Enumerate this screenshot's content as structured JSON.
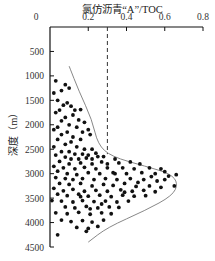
{
  "chart_data": {
    "type": "scatter",
    "title": "氯仿沥青“A”/TOC",
    "xlabel": "氯仿沥青“A”/TOC",
    "ylabel": "深度（m）",
    "x_axis_position": "top",
    "y_axis_inverted": true,
    "xlim": [
      0,
      0.8
    ],
    "ylim": [
      0,
      4500
    ],
    "x_ticks": [
      "0",
      "0.2",
      "0.4",
      "0.6",
      "0.8"
    ],
    "y_ticks": [
      "0",
      "500",
      "1000",
      "1500",
      "2000",
      "2500",
      "3000",
      "3500",
      "4000",
      "4500"
    ],
    "grid": false,
    "legend": null,
    "annotations": [
      {
        "type": "dashed_vertical_line",
        "x": 0.3,
        "y_from": 0,
        "y_to": 2600
      },
      {
        "type": "envelope_curve",
        "points": [
          [
            0.1,
            800
          ],
          [
            0.15,
            1300
          ],
          [
            0.22,
            1900
          ],
          [
            0.25,
            2400
          ],
          [
            0.32,
            2650
          ],
          [
            0.5,
            2850
          ],
          [
            0.63,
            3000
          ],
          [
            0.67,
            3200
          ],
          [
            0.64,
            3450
          ],
          [
            0.5,
            3750
          ],
          [
            0.3,
            4100
          ],
          [
            0.2,
            4400
          ]
        ]
      }
    ],
    "series": [
      {
        "name": "samples",
        "marker": "circle",
        "color": "#111111",
        "points": [
          [
            0.03,
            1100
          ],
          [
            0.06,
            1300
          ],
          [
            0.1,
            1250
          ],
          [
            0.02,
            1350
          ],
          [
            0.08,
            1180
          ],
          [
            0.04,
            1500
          ],
          [
            0.07,
            1600
          ],
          [
            0.11,
            1620
          ],
          [
            0.13,
            1700
          ],
          [
            0.16,
            1690
          ],
          [
            0.09,
            1550
          ],
          [
            0.05,
            1700
          ],
          [
            0.12,
            1800
          ],
          [
            0.03,
            1750
          ],
          [
            0.08,
            1850
          ],
          [
            0.15,
            1900
          ],
          [
            0.18,
            1950
          ],
          [
            0.06,
            1920
          ],
          [
            0.1,
            2000
          ],
          [
            0.04,
            2050
          ],
          [
            0.14,
            2050
          ],
          [
            0.2,
            2100
          ],
          [
            0.17,
            2150
          ],
          [
            0.02,
            2100
          ],
          [
            0.09,
            2150
          ],
          [
            0.12,
            2250
          ],
          [
            0.06,
            2200
          ],
          [
            0.16,
            2300
          ],
          [
            0.21,
            2200
          ],
          [
            0.04,
            2300
          ],
          [
            0.11,
            2350
          ],
          [
            0.08,
            2400
          ],
          [
            0.14,
            2450
          ],
          [
            0.18,
            2500
          ],
          [
            0.22,
            2500
          ],
          [
            0.02,
            2450
          ],
          [
            0.06,
            2550
          ],
          [
            0.1,
            2550
          ],
          [
            0.13,
            2600
          ],
          [
            0.17,
            2600
          ],
          [
            0.2,
            2620
          ],
          [
            0.24,
            2580
          ],
          [
            0.25,
            2650
          ],
          [
            0.03,
            2620
          ],
          [
            0.08,
            2660
          ],
          [
            0.11,
            2700
          ],
          [
            0.15,
            2700
          ],
          [
            0.19,
            2680
          ],
          [
            0.22,
            2700
          ],
          [
            0.28,
            2650
          ],
          [
            0.34,
            2700
          ],
          [
            0.05,
            2750
          ],
          [
            0.1,
            2800
          ],
          [
            0.16,
            2780
          ],
          [
            0.22,
            2800
          ],
          [
            0.27,
            2760
          ],
          [
            0.3,
            2800
          ],
          [
            0.36,
            2780
          ],
          [
            0.42,
            2760
          ],
          [
            0.47,
            2800
          ],
          [
            0.02,
            2850
          ],
          [
            0.07,
            2880
          ],
          [
            0.13,
            2900
          ],
          [
            0.18,
            2870
          ],
          [
            0.24,
            2900
          ],
          [
            0.3,
            2880
          ],
          [
            0.38,
            2880
          ],
          [
            0.44,
            2900
          ],
          [
            0.52,
            2880
          ],
          [
            0.58,
            2900
          ],
          [
            0.04,
            2950
          ],
          [
            0.09,
            3000
          ],
          [
            0.14,
            3020
          ],
          [
            0.2,
            2980
          ],
          [
            0.26,
            3000
          ],
          [
            0.33,
            2980
          ],
          [
            0.4,
            3000
          ],
          [
            0.48,
            2980
          ],
          [
            0.55,
            3000
          ],
          [
            0.62,
            3050
          ],
          [
            0.66,
            3020
          ],
          [
            0.03,
            3080
          ],
          [
            0.08,
            3100
          ],
          [
            0.12,
            3120
          ],
          [
            0.17,
            3100
          ],
          [
            0.23,
            3120
          ],
          [
            0.29,
            3100
          ],
          [
            0.35,
            3120
          ],
          [
            0.42,
            3100
          ],
          [
            0.49,
            3120
          ],
          [
            0.56,
            3150
          ],
          [
            0.6,
            3120
          ],
          [
            0.05,
            3200
          ],
          [
            0.1,
            3220
          ],
          [
            0.16,
            3200
          ],
          [
            0.22,
            3250
          ],
          [
            0.28,
            3220
          ],
          [
            0.33,
            3240
          ],
          [
            0.39,
            3200
          ],
          [
            0.45,
            3260
          ],
          [
            0.52,
            3250
          ],
          [
            0.58,
            3280
          ],
          [
            0.65,
            3250
          ],
          [
            0.02,
            3300
          ],
          [
            0.07,
            3350
          ],
          [
            0.12,
            3320
          ],
          [
            0.18,
            3360
          ],
          [
            0.24,
            3340
          ],
          [
            0.3,
            3360
          ],
          [
            0.37,
            3330
          ],
          [
            0.43,
            3360
          ],
          [
            0.49,
            3340
          ],
          [
            0.55,
            3370
          ],
          [
            0.04,
            3420
          ],
          [
            0.09,
            3450
          ],
          [
            0.15,
            3420
          ],
          [
            0.2,
            3460
          ],
          [
            0.26,
            3440
          ],
          [
            0.32,
            3470
          ],
          [
            0.38,
            3440
          ],
          [
            0.44,
            3460
          ],
          [
            0.5,
            3450
          ],
          [
            0.01,
            3550
          ],
          [
            0.06,
            3560
          ],
          [
            0.12,
            3580
          ],
          [
            0.17,
            3550
          ],
          [
            0.23,
            3570
          ],
          [
            0.29,
            3560
          ],
          [
            0.35,
            3580
          ],
          [
            0.41,
            3560
          ],
          [
            0.08,
            3680
          ],
          [
            0.13,
            3700
          ],
          [
            0.19,
            3670
          ],
          [
            0.25,
            3700
          ],
          [
            0.31,
            3680
          ],
          [
            0.36,
            3690
          ],
          [
            0.03,
            3800
          ],
          [
            0.09,
            3820
          ],
          [
            0.15,
            3790
          ],
          [
            0.21,
            3830
          ],
          [
            0.27,
            3800
          ],
          [
            0.32,
            3820
          ],
          [
            0.06,
            3950
          ],
          [
            0.11,
            3980
          ],
          [
            0.17,
            3960
          ],
          [
            0.22,
            3990
          ],
          [
            0.28,
            3950
          ],
          [
            0.14,
            4100
          ],
          [
            0.2,
            4120
          ],
          [
            0.25,
            4080
          ],
          [
            0.04,
            4250
          ],
          [
            0.19,
            4180
          ],
          [
            0.21,
            3720
          ],
          [
            0.27,
            3620
          ],
          [
            0.16,
            3470
          ],
          [
            0.34,
            3000
          ],
          [
            0.46,
            3180
          ],
          [
            0.39,
            3380
          ],
          [
            0.53,
            3060
          ],
          [
            0.6,
            2960
          ]
        ]
      }
    ]
  }
}
